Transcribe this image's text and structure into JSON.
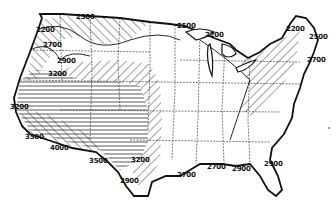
{
  "map": {
    "title": "United States contour map",
    "style": "black-and-white line map with hatched zones",
    "colors": {
      "ink": "#111111",
      "background": "#ffffff"
    },
    "contour_labels": [
      {
        "id": "l1",
        "text": "2500",
        "x": 76,
        "y": 14
      },
      {
        "id": "l2",
        "text": "2200",
        "x": 36,
        "y": 27
      },
      {
        "id": "l3",
        "text": "2700",
        "x": 43,
        "y": 42
      },
      {
        "id": "l4",
        "text": "2900",
        "x": 57,
        "y": 58
      },
      {
        "id": "l5",
        "text": "3200",
        "x": 48,
        "y": 71
      },
      {
        "id": "l6",
        "text": "3200",
        "x": 10,
        "y": 104
      },
      {
        "id": "l7",
        "text": "3500",
        "x": 25,
        "y": 134
      },
      {
        "id": "l8",
        "text": "4000",
        "x": 50,
        "y": 145
      },
      {
        "id": "l9",
        "text": "3500",
        "x": 89,
        "y": 158
      },
      {
        "id": "l10",
        "text": "3200",
        "x": 131,
        "y": 157
      },
      {
        "id": "l11",
        "text": "2900",
        "x": 120,
        "y": 178
      },
      {
        "id": "l12",
        "text": "2500",
        "x": 177,
        "y": 23
      },
      {
        "id": "l13",
        "text": "2200",
        "x": 205,
        "y": 32
      },
      {
        "id": "l14",
        "text": "2200",
        "x": 286,
        "y": 26
      },
      {
        "id": "l15",
        "text": "2500",
        "x": 309,
        "y": 34
      },
      {
        "id": "l16",
        "text": "2700",
        "x": 307,
        "y": 57
      },
      {
        "id": "l17",
        "text": "2700",
        "x": 177,
        "y": 172
      },
      {
        "id": "l18",
        "text": "2700",
        "x": 207,
        "y": 164
      },
      {
        "id": "l19",
        "text": "2900",
        "x": 232,
        "y": 166
      },
      {
        "id": "l20",
        "text": "2900",
        "x": 264,
        "y": 161
      }
    ]
  }
}
